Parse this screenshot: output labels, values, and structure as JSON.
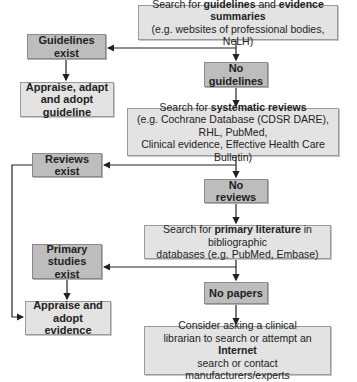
{
  "flowchart": {
    "nodes": {
      "search_guidelines": {
        "pre": "Search for ",
        "bold1": "guidelines",
        "mid": " and ",
        "bold2": "evidence summaries",
        "line2": "(e.g. websites of professional bodies, NeLH)"
      },
      "guidelines_exist": {
        "label": "Guidelines exist"
      },
      "appraise_guideline": {
        "line1": "Appraise, adapt",
        "line2": "and adopt guideline"
      },
      "no_guidelines": {
        "label": "No guidelines"
      },
      "search_reviews": {
        "pre": "Search for ",
        "bold": "systematic reviews",
        "line2": "(e.g. Cochrane Database (CDSR DARE), RHL, PubMed,",
        "line3": "Clinical evidence, Effective Health Care Bulletin)"
      },
      "reviews_exist": {
        "label": "Reviews exist"
      },
      "no_reviews": {
        "label": "No reviews"
      },
      "search_primary": {
        "pre": "Search for ",
        "bold": "primary literature",
        "post": " in bibliographic",
        "line2": "databases (e.g. PubMed, Embase)"
      },
      "primary_exist": {
        "line1": "Primary",
        "line2": "studies exist"
      },
      "no_papers": {
        "label": "No papers"
      },
      "appraise_evidence": {
        "line1": "Appraise and",
        "line2": "adopt evidence"
      },
      "consider_librarian": {
        "line1": "Consider asking a clinical",
        "line2_pre": "librarian to search or attempt an ",
        "line2_bold": "Internet",
        "line3": "search or contact manufacturers/experts"
      }
    },
    "colors": {
      "light_box": "#e3e3e3",
      "dark_box": "#bdbdbd",
      "line": "#222222"
    }
  }
}
